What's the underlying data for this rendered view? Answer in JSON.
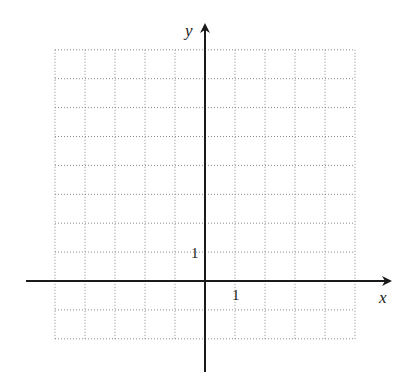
{
  "diagram": {
    "type": "coordinate-grid",
    "axes": {
      "x_label": "x",
      "y_label": "y"
    },
    "grid": {
      "x_min": -5,
      "x_max": 5,
      "y_min": -2,
      "y_max": 8,
      "step": 1,
      "line_style": "dotted"
    },
    "tick_labels": {
      "x_unit": "1",
      "y_unit": "1"
    },
    "colors": {
      "axis": "#1a1a1a",
      "grid": "#8a8a8a",
      "background": "#ffffff"
    }
  }
}
